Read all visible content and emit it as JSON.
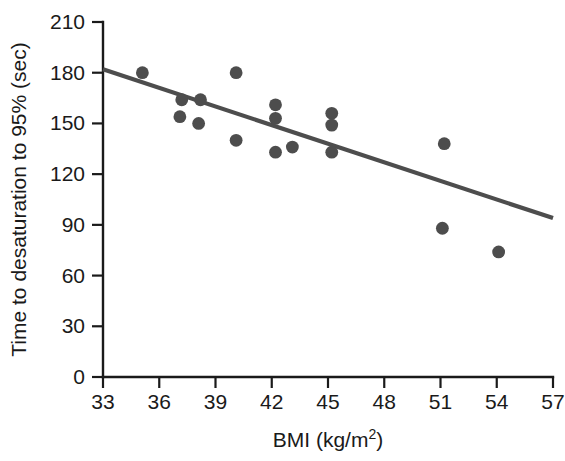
{
  "chart_data": {
    "type": "scatter",
    "title": "",
    "xlabel": "BMI (kg/m2)",
    "xlabel_base": "BMI (kg/m",
    "xlabel_sup": "2",
    "xlabel_tail": ")",
    "ylabel": "Time to desaturation to 95% (sec)",
    "xlim": [
      33,
      57
    ],
    "ylim": [
      0,
      210
    ],
    "xticks": [
      33,
      36,
      39,
      42,
      45,
      48,
      51,
      54,
      57
    ],
    "yticks": [
      0,
      30,
      60,
      90,
      120,
      150,
      180,
      210
    ],
    "grid": false,
    "legend": null,
    "point_color": "#4d4d4d",
    "line_color": "#4d4d4d",
    "axis_color": "#1a1a1a",
    "points": [
      {
        "x": 35.1,
        "y": 180
      },
      {
        "x": 37.2,
        "y": 164
      },
      {
        "x": 37.1,
        "y": 154
      },
      {
        "x": 38.2,
        "y": 164
      },
      {
        "x": 38.1,
        "y": 150
      },
      {
        "x": 40.1,
        "y": 180
      },
      {
        "x": 40.1,
        "y": 140
      },
      {
        "x": 42.2,
        "y": 161
      },
      {
        "x": 42.2,
        "y": 153
      },
      {
        "x": 42.2,
        "y": 133
      },
      {
        "x": 43.1,
        "y": 136
      },
      {
        "x": 45.2,
        "y": 156
      },
      {
        "x": 45.2,
        "y": 149
      },
      {
        "x": 45.2,
        "y": 133
      },
      {
        "x": 51.2,
        "y": 138
      },
      {
        "x": 51.1,
        "y": 88
      },
      {
        "x": 54.1,
        "y": 74
      }
    ],
    "fit_line": {
      "x0": 33,
      "y0": 182,
      "x1": 57,
      "y1": 94
    }
  }
}
